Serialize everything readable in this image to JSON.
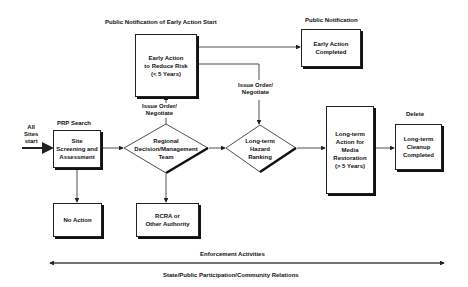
{
  "labels": {
    "public_notification_start": "Public Notification of Early Action Start",
    "public_notification": "Public Notification",
    "prp_search": "PRP Search",
    "all_sites_start": "All\nSites\nstart",
    "issue_order_left": "Issue Order/\nNegotiate",
    "issue_order_right": "Issue Order/\nNegotiate",
    "delete": "Delete",
    "enforcement": "Enforcement Activities",
    "state_public": "State/Public Participation/Community Relations"
  },
  "boxes": {
    "early_action": "Early Action\nto Reduce Risk\n(< 5 Years)",
    "early_action_completed": "Early Action\nCompleted",
    "site_screening": "Site\nScreening and\nAssessment",
    "no_action": "No Action",
    "rcra": "RCRA or\nOther Authority",
    "long_term_action": "Long-term\nAction for\nMedia\nRestoration\n(> 5 Years)",
    "long_term_cleanup": "Long-term\nCleanup\nCompleted"
  },
  "diamonds": {
    "regional": "Regional\nDecision/Management\nTeam",
    "hazard_ranking": "Long-term\nHazard\nRanking"
  },
  "colors": {
    "line": "#222222",
    "shadow": "#111111",
    "background": "#ffffff"
  }
}
